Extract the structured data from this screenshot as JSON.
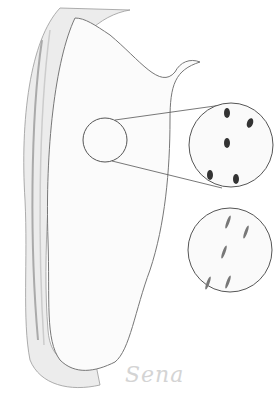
{
  "illustration": {
    "subject": "sketch of elongated tissue/organ wall with magnified insets",
    "signature": "Sena",
    "insets": [
      {
        "name": "upper-magnified-view",
        "description": "cells with dark round-oval nuclei"
      },
      {
        "name": "lower-magnified-view",
        "description": "cells with thin elongated spindle nuclei"
      }
    ],
    "colors": {
      "background": "#ffffff",
      "line": "#555555",
      "shading": "#bbbbbb",
      "nucleus_dark": "#333333",
      "nucleus_light": "#777777"
    }
  }
}
